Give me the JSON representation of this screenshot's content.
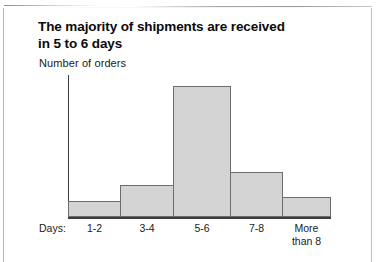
{
  "figure": {
    "title_line1": "The majority of shipments are received",
    "title_line2": "in 5 to 6 days",
    "y_axis_label": "Number of orders",
    "category_caption": "Days:",
    "more_label_line1": "More",
    "more_label_line2": "than 8",
    "bar_fill_color": "#d4d4d4",
    "bar_outline_color": "#6d6d6d",
    "axis_color": "#3c3c3c",
    "background_color": "#ffffff"
  },
  "chart_data": {
    "type": "bar",
    "title": "The majority of shipments are received in 5 to 6 days",
    "subtitle": "",
    "xlabel": "Days:",
    "ylabel": "Number of orders",
    "categories": [
      "1-2",
      "3-4",
      "5-6",
      "7-8",
      "More than 8"
    ],
    "values": [
      16,
      32,
      131,
      45,
      20
    ],
    "value_units": "relative bar height in pixels",
    "ylim": [
      0,
      142
    ],
    "grid": false,
    "legend": false,
    "axis_ticks_labeled": false
  }
}
